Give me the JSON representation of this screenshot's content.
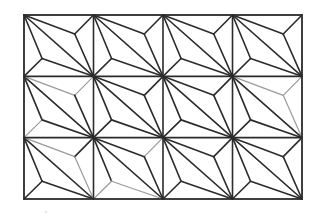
{
  "diagram": {
    "grid": {
      "x0": 24,
      "y0": 15,
      "x1": 302,
      "y1": 199,
      "columns": 4,
      "rows": 3
    },
    "cell_template": {
      "points": {
        "TL": [
          0,
          0
        ],
        "TR": [
          1,
          0
        ],
        "BL": [
          0,
          1
        ],
        "BR": [
          1,
          1
        ],
        "A": [
          0.73,
          0.31
        ],
        "B": [
          0.26,
          0.71
        ]
      },
      "edges": [
        [
          "TL",
          "BR"
        ],
        [
          "TL",
          "A"
        ],
        [
          "A",
          "TR"
        ],
        [
          "A",
          "BR"
        ],
        [
          "TL",
          "B"
        ],
        [
          "B",
          "BL"
        ],
        [
          "B",
          "BR"
        ]
      ]
    },
    "light_edges": {
      "1,0": [
        [
          "TL",
          "A"
        ],
        [
          "A",
          "TR"
        ],
        [
          "B",
          "BL"
        ]
      ],
      "1,3": [
        [
          "TL",
          "A"
        ],
        [
          "A",
          "TR"
        ],
        [
          "A",
          "BR"
        ]
      ],
      "2,0": [
        [
          "TL",
          "A"
        ],
        [
          "A",
          "BR"
        ]
      ],
      "2,1": [
        [
          "A",
          "TR"
        ],
        [
          "B",
          "BR"
        ],
        [
          "B",
          "BL"
        ]
      ]
    },
    "colors": {
      "line_dark": "#2b2b2b",
      "line_light": "#9a9a9a",
      "background": "#ffffff"
    }
  }
}
